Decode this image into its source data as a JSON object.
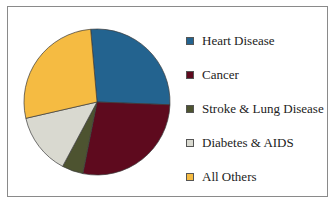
{
  "chart_data": {
    "type": "pie",
    "title": "",
    "categories": [
      "Heart Disease",
      "Cancer",
      "Stroke & Lung Disease",
      "Diabetes & AIDS",
      "All Others"
    ],
    "values": [
      27,
      27.5,
      4.7,
      13.6,
      27.2
    ],
    "colors": [
      "#23638f",
      "#5e0a1e",
      "#4d5330",
      "#d9d9d0",
      "#f5bb42"
    ],
    "start_angle_deg": -5,
    "legend_position": "right"
  },
  "legend": {
    "items": [
      {
        "label": "Heart Disease"
      },
      {
        "label": "Cancer"
      },
      {
        "label": "Stroke & Lung Disease"
      },
      {
        "label": "Diabetes & AIDS"
      },
      {
        "label": "All Others"
      }
    ]
  }
}
